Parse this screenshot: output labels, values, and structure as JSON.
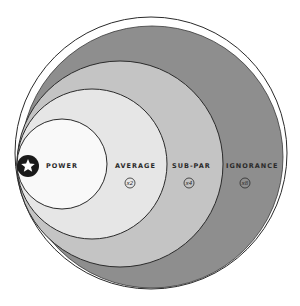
{
  "diagram": {
    "type": "nested-tangent-circles",
    "colors": {
      "power": "#f9f9f9",
      "average": "#e6e6e6",
      "subpar": "#c4c4c4",
      "ignorance": "#8e8e8e",
      "outline": "#2a2a2a",
      "badge": "#1a1a1a"
    },
    "levels": [
      {
        "label": "POWER",
        "multiplier": ""
      },
      {
        "label": "AVERAGE",
        "multiplier": "x2"
      },
      {
        "label": "SUB-PAR",
        "multiplier": "x4"
      },
      {
        "label": "IGNORANCE",
        "multiplier": "x8"
      }
    ],
    "badge_icon": "star-icon"
  }
}
